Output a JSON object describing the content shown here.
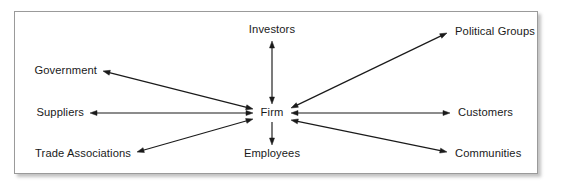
{
  "diagram": {
    "type": "hub-and-spoke relationship diagram",
    "canvas": {
      "width": 574,
      "height": 189
    },
    "frame": {
      "x": 14,
      "y": 11,
      "width": 524,
      "height": 163,
      "border_color": "#9a9a9a",
      "background": "#ffffff",
      "shadow_color": "#787878"
    },
    "style": {
      "line_color": "#1a1a1a",
      "text_color": "#1a1a1a",
      "font_size_px": 11.2,
      "arrow_head_length": 7,
      "arrow_head_width": 5
    },
    "hub": {
      "id": "firm",
      "label": "Firm",
      "x": 272,
      "y": 113,
      "anchor": "center",
      "half_width": 18,
      "half_height": 7
    },
    "nodes": [
      {
        "id": "investors",
        "label": "Investors",
        "x": 272,
        "y": 30,
        "anchor": "center"
      },
      {
        "id": "political-groups",
        "label": "Political Groups",
        "x": 455,
        "y": 32,
        "anchor": "left"
      },
      {
        "id": "government",
        "label": "Government",
        "x": 97,
        "y": 71,
        "anchor": "right"
      },
      {
        "id": "suppliers",
        "label": "Suppliers",
        "x": 84,
        "y": 113,
        "anchor": "right"
      },
      {
        "id": "customers",
        "label": "Customers",
        "x": 458,
        "y": 113,
        "anchor": "left"
      },
      {
        "id": "trade-associations",
        "label": "Trade Associations",
        "x": 131,
        "y": 154,
        "anchor": "right"
      },
      {
        "id": "employees",
        "label": "Employees",
        "x": 272,
        "y": 154,
        "anchor": "center"
      },
      {
        "id": "communities",
        "label": "Communities",
        "x": 455,
        "y": 154,
        "anchor": "left"
      }
    ],
    "edges": [
      {
        "id": "edge-firm-investors",
        "from": "firm",
        "to": "investors",
        "x1": 272,
        "y1": 104,
        "x2": 272,
        "y2": 41,
        "arrow_start": true,
        "arrow_end": true
      },
      {
        "id": "edge-firm-employees",
        "from": "firm",
        "to": "employees",
        "x1": 272,
        "y1": 122,
        "x2": 272,
        "y2": 145,
        "arrow_start": false,
        "arrow_end": true
      },
      {
        "id": "edge-firm-government",
        "from": "firm",
        "to": "government",
        "x1": 253,
        "y1": 109,
        "x2": 103,
        "y2": 71,
        "arrow_start": true,
        "arrow_end": true
      },
      {
        "id": "edge-firm-suppliers",
        "from": "firm",
        "to": "suppliers",
        "x1": 253,
        "y1": 113,
        "x2": 90,
        "y2": 113,
        "arrow_start": true,
        "arrow_end": true
      },
      {
        "id": "edge-firm-trade-associations",
        "from": "firm",
        "to": "trade-associations",
        "x1": 253,
        "y1": 119,
        "x2": 137,
        "y2": 152,
        "arrow_start": true,
        "arrow_end": true
      },
      {
        "id": "edge-firm-political-groups",
        "from": "firm",
        "to": "political-groups",
        "x1": 291,
        "y1": 108,
        "x2": 447,
        "y2": 33,
        "arrow_start": true,
        "arrow_end": true
      },
      {
        "id": "edge-firm-customers",
        "from": "firm",
        "to": "customers",
        "x1": 291,
        "y1": 113,
        "x2": 450,
        "y2": 113,
        "arrow_start": true,
        "arrow_end": true
      },
      {
        "id": "edge-firm-communities",
        "from": "firm",
        "to": "communities",
        "x1": 291,
        "y1": 120,
        "x2": 447,
        "y2": 152,
        "arrow_start": true,
        "arrow_end": true
      }
    ]
  }
}
